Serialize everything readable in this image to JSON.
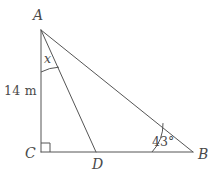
{
  "figure": {
    "background_color": "#ffffff",
    "stroke_color": "#555555",
    "text_color": "#4a4a4a",
    "stroke_width": 1
  },
  "vertices": {
    "A": {
      "label": "A",
      "x": 41,
      "y": 30
    },
    "B": {
      "label": "B",
      "x": 193,
      "y": 152
    },
    "C": {
      "label": "C",
      "x": 41,
      "y": 152
    },
    "D": {
      "label": "D",
      "x": 96,
      "y": 152
    }
  },
  "segments": [
    {
      "name": "AC",
      "from": "A",
      "to": "C"
    },
    {
      "name": "CB",
      "from": "C",
      "to": "B"
    },
    {
      "name": "AB",
      "from": "A",
      "to": "B"
    },
    {
      "name": "AD",
      "from": "A",
      "to": "D"
    }
  ],
  "labels": {
    "vertex_a": "A",
    "vertex_b": "B",
    "vertex_c": "C",
    "vertex_d": "D",
    "side_ac_measure": "14 m",
    "angle_at_a": "x",
    "angle_at_b": "43°",
    "right_angle_at_c": "90°"
  },
  "markings": {
    "right_angle_square": {
      "vertex": "C",
      "size": 9
    },
    "arc_angle_a": {
      "vertex": "A",
      "between": [
        "AC",
        "AD"
      ],
      "radius": 42,
      "label": "x"
    },
    "arc_angle_b": {
      "vertex": "B",
      "between": [
        "BC",
        "BA"
      ],
      "radius": 41,
      "label": "43°"
    }
  }
}
